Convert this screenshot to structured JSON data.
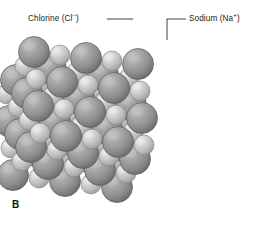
{
  "figure": {
    "panel_letter": "B",
    "background_color": "#ffffff"
  },
  "callouts": [
    {
      "name": "chlorine",
      "text_before": "Chlorine (Cl",
      "charge": "–",
      "text_after": ")",
      "leader": {
        "x1": 107,
        "y1": 19,
        "x2": 133,
        "y2": 19,
        "bend": false
      }
    },
    {
      "name": "sodium",
      "text_before": "Sodium (Na",
      "charge": "+",
      "text_after": ")",
      "leader": {
        "x1": 186,
        "y1": 19,
        "x2": 167,
        "y2": 19,
        "bend": true,
        "x3": 167,
        "y3": 40
      }
    }
  ],
  "ions": {
    "chloride": {
      "label": "chloride-ion",
      "radius": 15.5,
      "fill_light": "#bdbdbd",
      "fill_mid": "#9a9a9a",
      "fill_dark": "#6e6e6e",
      "stroke": "#5d5d5d"
    },
    "sodium": {
      "label": "sodium-ion",
      "radius": 10.0,
      "fill_light": "#eaeaea",
      "fill_mid": "#cfcfcf",
      "fill_dark": "#a4a4a4",
      "stroke": "#8a8a8a"
    }
  },
  "lattice": {
    "description": "rock-salt face-centred cubic packing of alternating large chloride and small sodium spheres",
    "origin": {
      "x": 34,
      "y": 52
    },
    "vec_a": {
      "x": 26.0,
      "y": 3.0
    },
    "vec_b": {
      "x": -9.0,
      "y": 14.0
    },
    "vec_c": {
      "x": 2.0,
      "y": 27.0
    },
    "counts": {
      "a": 5,
      "b": 4,
      "c": 4
    }
  }
}
